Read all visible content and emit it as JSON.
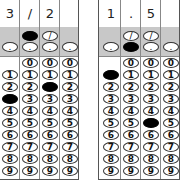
{
  "grids": [
    {
      "id": "left",
      "answer": "3/2",
      "header": [
        "3",
        "/",
        "2",
        ""
      ],
      "slash_columns": [
        1,
        2
      ],
      "decimal_columns": [
        0,
        1,
        2,
        3
      ],
      "digit_columns": {
        "zero_start": 1
      },
      "filled": [
        {
          "column": 0,
          "value": "3"
        },
        {
          "column": 1,
          "value": "/"
        },
        {
          "column": 2,
          "value": "2"
        }
      ]
    },
    {
      "id": "right",
      "answer": "1.5",
      "header": [
        "1",
        ".",
        "5",
        ""
      ],
      "slash_columns": [
        1,
        2
      ],
      "decimal_columns": [
        0,
        1,
        2,
        3
      ],
      "digit_columns": {
        "zero_start": 1
      },
      "filled": [
        {
          "column": 0,
          "value": "1"
        },
        {
          "column": 1,
          "value": "."
        },
        {
          "column": 2,
          "value": "5"
        }
      ]
    }
  ],
  "symbols": {
    "slash": "/",
    "decimal": "."
  },
  "digits": [
    "0",
    "1",
    "2",
    "3",
    "4",
    "5",
    "6",
    "7",
    "8",
    "9"
  ]
}
